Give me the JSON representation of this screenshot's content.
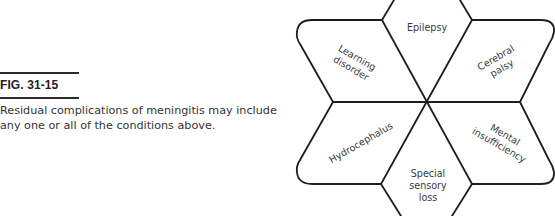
{
  "figure": {
    "label": "FIG. 31-15",
    "caption": "Residual complications of meningitis may include any one or all of the conditions above."
  },
  "diagram": {
    "type": "six-pointed star of rhombi",
    "center_label": "",
    "segments": [
      {
        "id": "top",
        "lines": [
          "Epilepsy"
        ]
      },
      {
        "id": "upper-right",
        "lines": [
          "Cerebral",
          "palsy"
        ]
      },
      {
        "id": "lower-right",
        "lines": [
          "Mental",
          "insufficiency"
        ]
      },
      {
        "id": "bottom",
        "lines": [
          "Special",
          "sensory",
          "loss"
        ]
      },
      {
        "id": "lower-left",
        "lines": [
          "Hydrocephalus"
        ]
      },
      {
        "id": "upper-left",
        "lines": [
          "Learning",
          "disorder"
        ]
      }
    ],
    "stroke_color": "#1e1e1e",
    "background": "#ffffff"
  }
}
